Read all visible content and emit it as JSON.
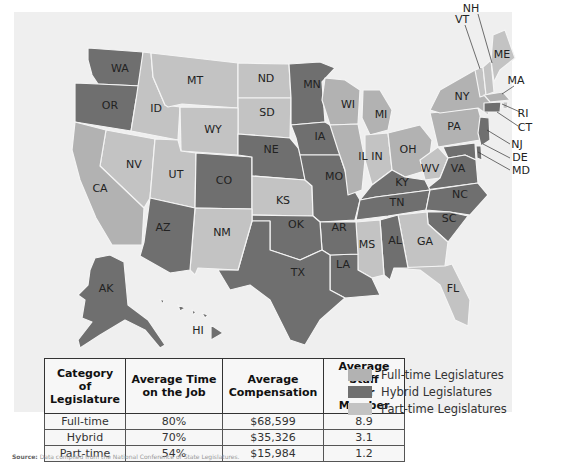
{
  "colors": {
    "panel": "#efefef",
    "full_time": "#b2b2b2",
    "hybrid": "#6f6f6f",
    "part_time": "#c3c3c3"
  },
  "map": {
    "state_labels": {
      "WA": "WA",
      "OR": "OR",
      "ID": "ID",
      "MT": "MT",
      "ND": "ND",
      "SD": "SD",
      "WY": "WY",
      "NV": "NV",
      "CA": "CA",
      "UT": "UT",
      "CO": "CO",
      "NE": "NE",
      "KS": "KS",
      "MN": "MN",
      "IA": "IA",
      "MO": "MO",
      "WI": "WI",
      "MI": "MI",
      "IL": "IL",
      "IN": "IN",
      "OH": "OH",
      "KY": "KY",
      "TN": "TN",
      "WV": "WV",
      "VA": "VA",
      "NC": "NC",
      "SC": "SC",
      "GA": "GA",
      "FL": "FL",
      "AL": "AL",
      "MS": "MS",
      "LA": "LA",
      "AR": "AR",
      "OK": "OK",
      "TX": "TX",
      "NM": "NM",
      "AZ": "AZ",
      "AK": "AK",
      "HI": "HI",
      "PA": "PA",
      "NY": "NY",
      "VT": "VT",
      "NH": "NH",
      "ME": "ME",
      "MA": "MA",
      "RI": "RI",
      "CT": "CT",
      "NJ": "NJ",
      "DE": "DE",
      "MD": "MD"
    },
    "categories": {
      "full_time": [
        "CA",
        "MI",
        "WI",
        "IL",
        "OH",
        "PA",
        "NY",
        "MA"
      ],
      "hybrid": [
        "WA",
        "OR",
        "CO",
        "NE",
        "MN",
        "IA",
        "MO",
        "AR",
        "OK",
        "TX",
        "LA",
        "AL",
        "KY",
        "TN",
        "VA",
        "NC",
        "SC",
        "AZ",
        "AK",
        "HI",
        "CT",
        "MD",
        "DE",
        "NJ"
      ],
      "part_time": [
        "ID",
        "MT",
        "ND",
        "SD",
        "WY",
        "NV",
        "UT",
        "KS",
        "NM",
        "IN",
        "WV",
        "MS",
        "GA",
        "FL",
        "VT",
        "NH",
        "ME",
        "RI"
      ]
    }
  },
  "table": {
    "headers": [
      [
        "Category of",
        "Legislature"
      ],
      [
        "Average Time",
        "on the Job"
      ],
      [
        "Average",
        "Compensation"
      ],
      [
        "Average Staff",
        "per Member"
      ]
    ],
    "rows": [
      [
        "Full-time",
        "80%",
        "$68,599",
        "8.9"
      ],
      [
        "Hybrid",
        "70%",
        "$35,326",
        "3.1"
      ],
      [
        "Part-time",
        "54%",
        "$15,984",
        "1.2"
      ]
    ]
  },
  "legend": [
    {
      "label": "Full-time Legislatures",
      "key": "full_time"
    },
    {
      "label": "Hybrid Legislatures",
      "key": "hybrid"
    },
    {
      "label": "Part-time Legislatures",
      "key": "part_time"
    }
  ],
  "source": {
    "prefix": "Source:",
    "text": "Data compiled from the National Conference of State Legislatures."
  }
}
